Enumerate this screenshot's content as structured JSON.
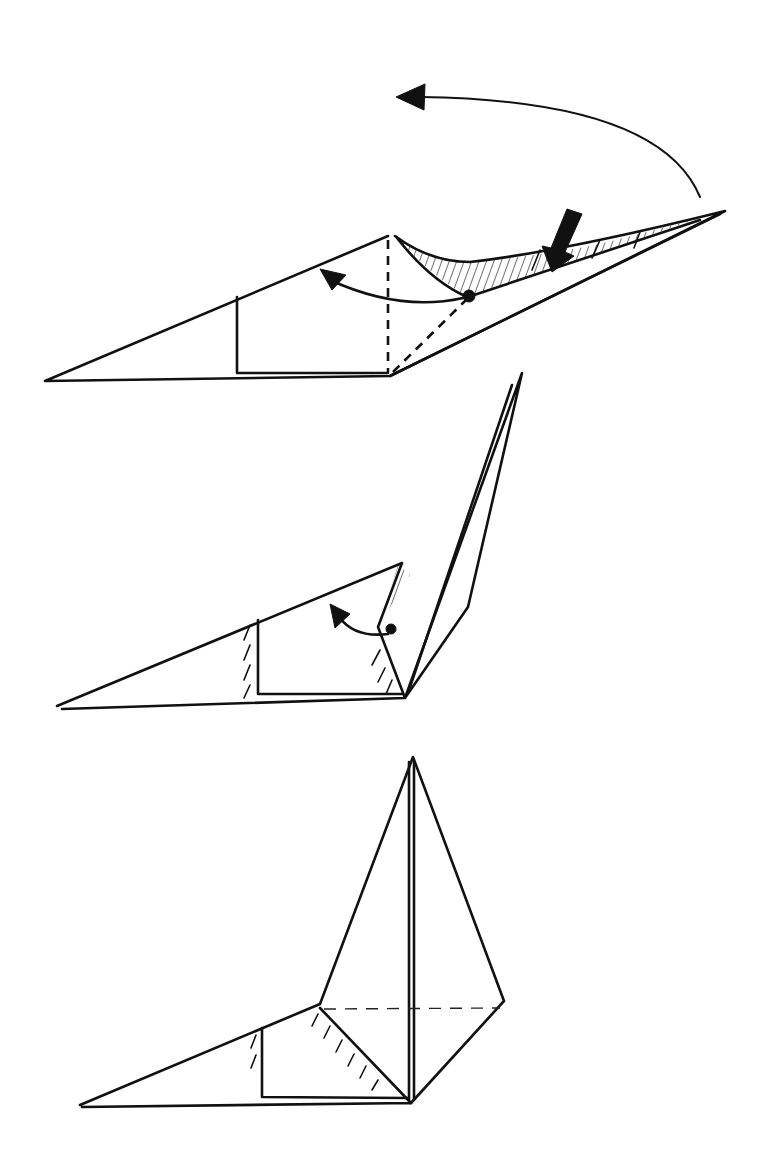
{
  "diagram": {
    "type": "origami-folding-steps",
    "background": "#ffffff",
    "ink_color": "#111111",
    "steps": [
      {
        "index": 1,
        "description": "Flat flap with point extending right; valley-fold (dashed) lines; push arrow and swing-over arrow",
        "outline": [
          [
            45,
            381
          ],
          [
            388,
            236
          ],
          [
            725,
            211
          ],
          [
            390,
            376
          ]
        ],
        "rectangle": [
          [
            237,
            297
          ],
          [
            237,
            373
          ],
          [
            388,
            373
          ]
        ],
        "dashed_lines": [
          [
            [
              388,
              236
            ],
            [
              388,
              376
            ]
          ],
          [
            [
              390,
              376
            ],
            [
              468,
              297
            ]
          ]
        ],
        "arrows": [
          {
            "kind": "curved-move",
            "from": [
              700,
              197
            ],
            "to": [
              398,
              96
            ]
          },
          {
            "kind": "curved-fold",
            "from": [
              468,
              297
            ],
            "to": [
              322,
              272
            ]
          },
          {
            "kind": "push",
            "from": [
              575,
              213
            ],
            "to": [
              550,
              270
            ]
          }
        ],
        "shaded_region": [
          [
            397,
            238
          ],
          [
            470,
            265
          ],
          [
            540,
            258
          ],
          [
            600,
            247
          ],
          [
            700,
            217
          ],
          [
            468,
            297
          ]
        ]
      },
      {
        "index": 2,
        "description": "Point raised upward; small flap being folded back",
        "outline": [
          [
            57,
            706
          ],
          [
            402,
            563
          ],
          [
            522,
            373
          ],
          [
            468,
            607
          ],
          [
            405,
            698
          ]
        ],
        "rectangle": [
          [
            258,
            620
          ],
          [
            258,
            694
          ],
          [
            405,
            694
          ]
        ],
        "arrows": [
          {
            "kind": "curved-fold",
            "from": [
              390,
              628
            ],
            "to": [
              330,
              607
            ]
          }
        ]
      },
      {
        "index": 3,
        "description": "Final result: tall vertical point with hidden (dashed) line at base",
        "outline": [
          [
            80,
            1105
          ],
          [
            320,
            1004
          ],
          [
            413,
            757
          ],
          [
            504,
            1001
          ],
          [
            411,
            1103
          ]
        ],
        "rectangle": [
          [
            262,
            1028
          ],
          [
            262,
            1097
          ],
          [
            411,
            1097
          ]
        ],
        "dashed_lines": [
          [
            [
              322,
              1010
            ],
            [
              500,
              1008
            ]
          ]
        ]
      }
    ]
  }
}
